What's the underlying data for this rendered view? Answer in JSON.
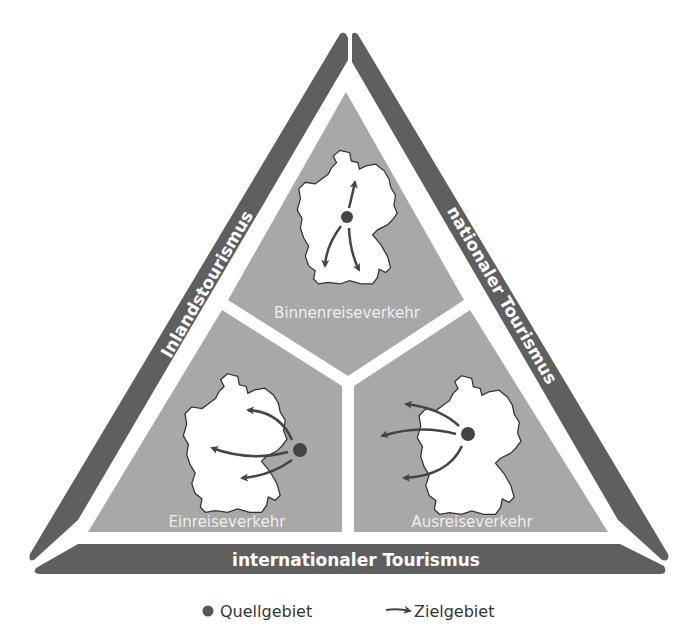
{
  "diagram": {
    "bands": {
      "left": "Inlandstourismus",
      "right": "nationaler Tourismus",
      "bottom": "internationaler Tourismus"
    },
    "regions": {
      "top": "Binnenreiseverkehr",
      "bottom_left": "Einreiseverkehr",
      "bottom_right": "Ausreiseverkehr"
    },
    "legend": {
      "source": "Quellgebiet",
      "destination": "Zielgebiet"
    },
    "colors": {
      "band": "#5f5f5f",
      "region": "#a8a8a8",
      "map": "#ffffff",
      "arrow": "#444444",
      "dot": "#444444"
    }
  }
}
